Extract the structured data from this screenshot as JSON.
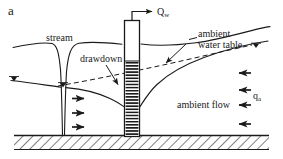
{
  "figure": {
    "panel_letter": "a",
    "type": "cross-section schematic of stream-aquifer pumping well",
    "labels": {
      "stream": "stream",
      "drawdown": "drawdown",
      "pumping_rate": "Q",
      "pumping_rate_sub": "w",
      "ambient_water_table_line1": "ambient",
      "ambient_water_table_line2": "water table",
      "ambient_flow": "ambient flow",
      "ambient_flux": "q",
      "ambient_flux_sub": "a"
    },
    "colors": {
      "line": "#1a1a1a",
      "background": "#ffffff",
      "bedrock_hatch": "#1a1a1a"
    },
    "elements": [
      "ground-surface",
      "stream-notch",
      "pumping-well",
      "well-screen",
      "water-table-drawdown-curve",
      "ambient-water-table-dashed",
      "bedrock-layer",
      "water-table-symbols",
      "flow-arrows-left",
      "flow-arrows-right",
      "discharge-arrow"
    ]
  }
}
